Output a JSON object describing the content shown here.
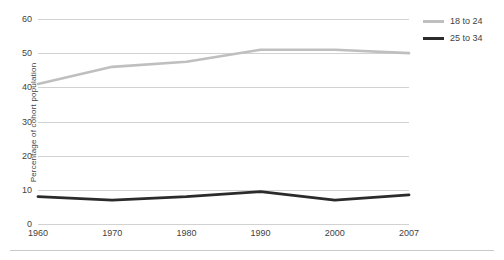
{
  "chart_data": {
    "type": "line",
    "title": "",
    "xlabel": "",
    "ylabel": "Percentage of cohort population",
    "categories": [
      "1960",
      "1970",
      "1980",
      "1990",
      "2000",
      "2007"
    ],
    "x": [
      1960,
      1970,
      1980,
      1990,
      2000,
      2007
    ],
    "series": [
      {
        "name": "18 to 24",
        "color": "#bfbfbf",
        "values": [
          41,
          46,
          47.5,
          51,
          51,
          50
        ]
      },
      {
        "name": "25 to 34",
        "color": "#2b2b2b",
        "values": [
          8,
          7,
          8,
          9.5,
          7,
          8.5
        ]
      }
    ],
    "yticks": [
      0,
      10,
      20,
      30,
      40,
      50,
      60
    ],
    "ytick_labels": [
      "0",
      "10",
      "20",
      "30",
      "40",
      "50",
      "60"
    ],
    "ylim": [
      0,
      60
    ],
    "xlim": [
      1960,
      2007
    ],
    "grid": true,
    "grid_color": "#d2d2d2",
    "legend_position": "right"
  },
  "legend": {
    "items": [
      {
        "label": "18 to 24",
        "color": "#bfbfbf"
      },
      {
        "label": "25 to 34",
        "color": "#2b2b2b"
      }
    ]
  },
  "axes": {
    "y_title": "Percentage of cohort population"
  }
}
